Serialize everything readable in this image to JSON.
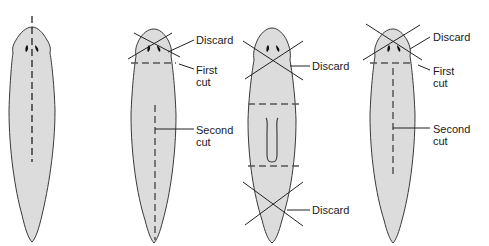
{
  "figure": {
    "panels": [
      {
        "id": "worm-1",
        "description": "Intact planarian with midline dashed cut through head",
        "labels": []
      },
      {
        "id": "worm-2",
        "labels": {
          "discard": "Discard",
          "first_cut_line1": "First",
          "first_cut_line2": "cut",
          "second_cut_line1": "Second",
          "second_cut_line2": "cut"
        }
      },
      {
        "id": "worm-3",
        "labels": {
          "discard_top": "Discard",
          "discard_bottom": "Discard"
        }
      },
      {
        "id": "worm-4",
        "labels": {
          "discard": "Discard",
          "first_cut_line1": "First",
          "first_cut_line2": "cut",
          "second_cut_line1": "Second",
          "second_cut_line2": "cut"
        }
      }
    ],
    "colors": {
      "body_fill": "#dcdcdc",
      "outline": "#3a3a3a",
      "cut_line": "#555555",
      "text": "#1a1a1a"
    }
  }
}
